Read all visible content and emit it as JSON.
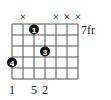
{
  "chord_diagram": {
    "strings": 7,
    "frets": 5,
    "fret_label": "7fr",
    "mutes": [
      2,
      5,
      6,
      7
    ],
    "mute_symbol": "×",
    "dots": [
      {
        "string": 3,
        "fret": 1,
        "label": "1"
      },
      {
        "string": 4,
        "fret": 3,
        "label": "3"
      },
      {
        "string": 1,
        "fret": 4,
        "label": "4"
      }
    ],
    "bottom_labels": [
      {
        "string": 1,
        "text": "1"
      },
      {
        "string": 3,
        "text": "5"
      },
      {
        "string": 4,
        "text": "2"
      }
    ],
    "colors": {
      "grid": "#555555",
      "dot": "#111111",
      "dot_text": "#ffffff",
      "text": "#222222"
    }
  }
}
